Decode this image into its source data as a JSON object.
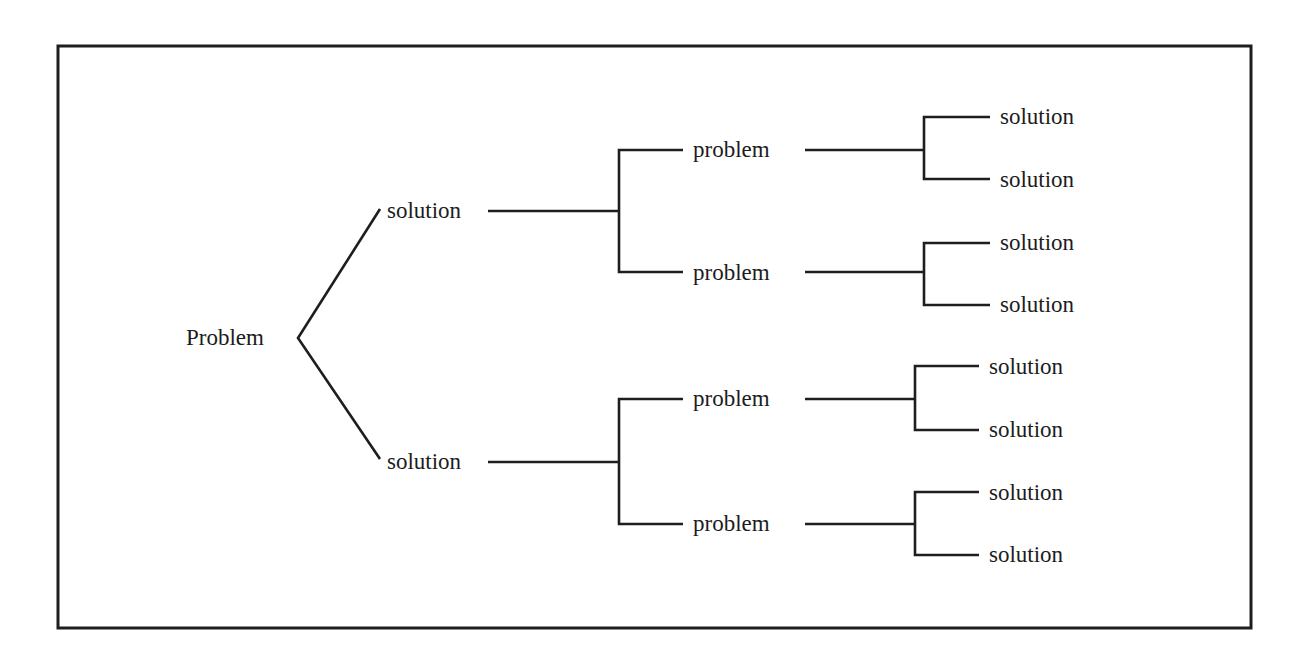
{
  "diagram": {
    "type": "tree",
    "title": "",
    "root": {
      "label": "Problem",
      "children": [
        {
          "label": "solution",
          "children": [
            {
              "label": "problem",
              "children": [
                {
                  "label": "solution"
                },
                {
                  "label": "solution"
                }
              ]
            },
            {
              "label": "problem",
              "children": [
                {
                  "label": "solution"
                },
                {
                  "label": "solution"
                }
              ]
            }
          ]
        },
        {
          "label": "solution",
          "children": [
            {
              "label": "problem",
              "children": [
                {
                  "label": "solution"
                },
                {
                  "label": "solution"
                }
              ]
            },
            {
              "label": "problem",
              "children": [
                {
                  "label": "solution"
                },
                {
                  "label": "solution"
                }
              ]
            }
          ]
        }
      ]
    },
    "labels": {
      "root": "Problem",
      "level1": [
        "solution",
        "solution"
      ],
      "level2": [
        "problem",
        "problem",
        "problem",
        "problem"
      ],
      "level3": [
        "solution",
        "solution",
        "solution",
        "solution",
        "solution",
        "solution",
        "solution",
        "solution"
      ]
    },
    "colors": {
      "line": "#1e1e1e",
      "text": "#1c1c1c",
      "background": "#ffffff"
    }
  }
}
